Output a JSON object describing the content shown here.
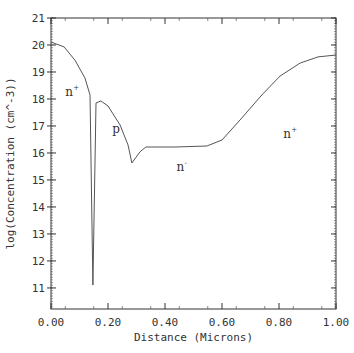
{
  "chart_data": {
    "type": "line",
    "title": "",
    "xlabel": "Distance (Microns)",
    "ylabel": "log(Concentration (cm^-3))",
    "xlim": [
      0.0,
      1.0
    ],
    "ylim": [
      10.22,
      21.0
    ],
    "grid": false,
    "x_ticks": [
      0.0,
      0.2,
      0.4,
      0.6,
      0.8,
      1.0
    ],
    "x_tick_labels": [
      "0.00",
      "0.20",
      "0.40",
      "0.60",
      "0.80",
      "1.00"
    ],
    "y_ticks": [
      11,
      12,
      13,
      14,
      15,
      16,
      17,
      18,
      19,
      20,
      21
    ],
    "y_tick_labels": [
      "11",
      "12",
      "13",
      "14",
      "15",
      "16",
      "17",
      "18",
      "19",
      "20",
      "21"
    ],
    "series": [
      {
        "name": "doping profile",
        "color": "#555555",
        "x": [
          0.0,
          0.046,
          0.084,
          0.119,
          0.137,
          0.147,
          0.158,
          0.175,
          0.2,
          0.242,
          0.27,
          0.284,
          0.312,
          0.333,
          0.435,
          0.547,
          0.6,
          0.663,
          0.74,
          0.804,
          0.874,
          0.937,
          1.0
        ],
        "y": [
          20.11,
          19.93,
          19.44,
          18.78,
          18.15,
          11.11,
          17.85,
          17.93,
          17.74,
          17.04,
          16.3,
          15.63,
          16.04,
          16.22,
          16.22,
          16.26,
          16.48,
          17.22,
          18.15,
          18.85,
          19.33,
          19.56,
          19.63
        ]
      }
    ],
    "annotations": [
      {
        "text": "n",
        "sup": "+",
        "x": 0.05,
        "y": 18.1
      },
      {
        "text": "p",
        "sup": "",
        "x": 0.215,
        "y": 16.75
      },
      {
        "text": "n",
        "sup": "-",
        "x": 0.44,
        "y": 15.35
      },
      {
        "text": "n",
        "sup": "+",
        "x": 0.815,
        "y": 16.55
      }
    ]
  }
}
